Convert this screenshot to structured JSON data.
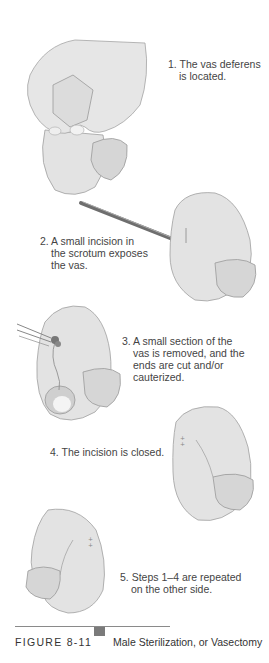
{
  "figure": {
    "label": "FIGURE 8-11",
    "title": "Male Sterilization, or Vasectomy",
    "accent_color": "#7a7a7a"
  },
  "steps": [
    {
      "number": "1.",
      "lines": [
        "The vas deferens",
        "is located."
      ]
    },
    {
      "number": "2.",
      "lines": [
        "A small incision in",
        "the scrotum exposes",
        "the vas."
      ]
    },
    {
      "number": "3.",
      "lines": [
        "A small section of the",
        "vas is removed, and the",
        "ends are cut and/or",
        "cauterized."
      ]
    },
    {
      "number": "4.",
      "lines": [
        "The incision is closed."
      ]
    },
    {
      "number": "5.",
      "lines": [
        "Steps 1–4 are repeated",
        "on the other side."
      ]
    }
  ],
  "illustrations": {
    "skin_fill": "#e2e2e2",
    "skin_shade": "#d2d2d2",
    "outline": "#9a9a9a"
  }
}
